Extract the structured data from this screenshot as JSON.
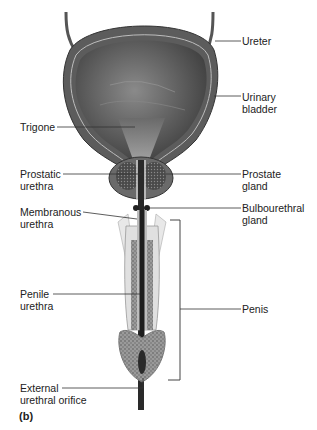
{
  "diagram": {
    "panel_label": "(b)",
    "labels": {
      "ureter": "Ureter",
      "urinary_bladder_1": "Urinary",
      "urinary_bladder_2": "bladder",
      "trigone": "Trigone",
      "prostatic_urethra_1": "Prostatic",
      "prostatic_urethra_2": "urethra",
      "prostate_gland_1": "Prostate",
      "prostate_gland_2": "gland",
      "membranous_urethra_1": "Membranous",
      "membranous_urethra_2": "urethra",
      "bulbourethral_gland_1": "Bulbourethral",
      "bulbourethral_gland_2": "gland",
      "penile_urethra_1": "Penile",
      "penile_urethra_2": "urethra",
      "penis": "Penis",
      "external_orifice_1": "External",
      "external_orifice_2": "urethral orifice"
    }
  }
}
